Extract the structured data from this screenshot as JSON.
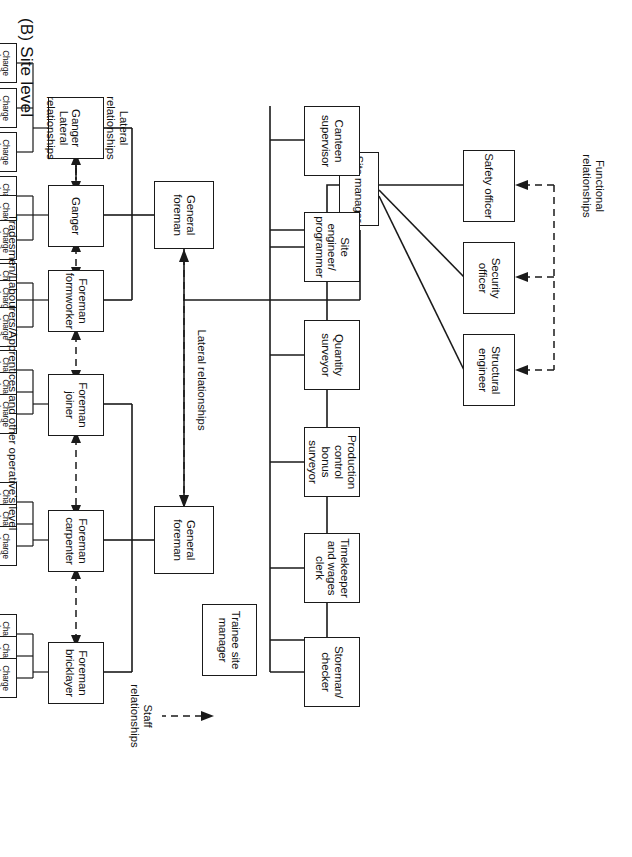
{
  "title": "(B) Site level",
  "side_note": "Tradesmen/Labourers/Apprentices and other operative's level",
  "labels": {
    "functional": "Functional\nrelationships",
    "staff": "Staff\nrelationships",
    "lateral_foremen": "Lateral relationships",
    "lateral_ganger_top": "Lateral\nrelationships",
    "lateral_chargehand_top": "Lateral\nrelationships"
  },
  "boxes": {
    "site_manager": "Site\nmanager",
    "trainee_site_manager": "Trainee\nsite\nmanager",
    "safety_officer": "Safety\nofficer",
    "security_officer": "Security\nofficer",
    "structural_engineer": "Structural\nengineer",
    "canteen_supervisor": "Canteen\nsupervisor",
    "site_engineer": "Site\nengineer/\nprogrammer",
    "quantity_surveyor": "Quantity\nsurveyor",
    "production_control": "Production\ncontrol\nbonus\nsurveyor",
    "timekeeper": "Timekeeper\nand\nwages clerk",
    "storeman": "Storeman/\nchecker",
    "general_foreman_1": "General\nforeman",
    "general_foreman_2": "General\nforeman",
    "ganger_1": "Ganger",
    "ganger_2": "Ganger",
    "foreman_formworker": "Foreman\nformworker",
    "foreman_joiner": "Foreman\njoiner",
    "foreman_carpenter": "Foreman\ncarpenter",
    "foreman_bricklayer": "Foreman\nbricklayer",
    "charge_hand": "Charge\nhand"
  },
  "chart_data": {
    "type": "diagram",
    "diagram_kind": "organisation-chart",
    "orientation": "page-rotated-90-clockwise",
    "levels": [
      {
        "name": "Site manager level",
        "nodes": [
          "Site manager"
        ]
      },
      {
        "name": "Functional / staff officers",
        "nodes": [
          "Safety officer",
          "Security officer",
          "Structural engineer"
        ]
      },
      {
        "name": "Trainee",
        "nodes": [
          "Trainee site manager"
        ]
      },
      {
        "name": "Site staff",
        "nodes": [
          "Canteen supervisor",
          "Site engineer/programmer",
          "Quantity surveyor",
          "Production control bonus surveyor",
          "Timekeeper and wages clerk",
          "Storeman/checker"
        ]
      },
      {
        "name": "General foremen",
        "nodes": [
          "General foreman",
          "General foreman"
        ]
      },
      {
        "name": "Foremen / gangers",
        "nodes": [
          "Ganger",
          "Ganger",
          "Foreman formworker",
          "Foreman joiner",
          "Foreman carpenter",
          "Foreman bricklayer"
        ]
      },
      {
        "name": "Charge hands",
        "count": 18,
        "nodes": [
          "Charge hand"
        ]
      },
      {
        "name": "Operatives",
        "nodes": [
          "Tradesmen/Labourers/Apprentices and other operative's level"
        ],
        "count_per_charge_hand": 3
      }
    ],
    "relationship_types": [
      {
        "name": "Functional relationships",
        "style": "dashed arrow"
      },
      {
        "name": "Staff relationships",
        "style": "dashed arrow"
      },
      {
        "name": "Lateral relationships",
        "style": "dashed double-headed arrow"
      },
      {
        "name": "Line relationships",
        "style": "solid line"
      }
    ]
  },
  "colors": {
    "ink": "#1a1a1a",
    "paper": "#ffffff"
  }
}
